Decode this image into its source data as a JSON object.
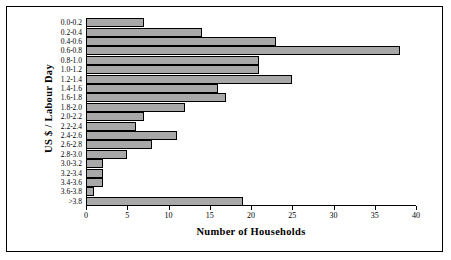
{
  "chart_data": {
    "type": "bar",
    "orientation": "horizontal",
    "title": "",
    "xlabel": "Number of Households",
    "ylabel": "US $ / Labour Day",
    "xlim": [
      0,
      40
    ],
    "xticks": [
      0,
      5,
      10,
      15,
      20,
      25,
      30,
      35,
      40
    ],
    "grid": false,
    "legend": null,
    "bar_color": "#a8a8a8",
    "bar_edge_color": "#000000",
    "categories": [
      "0.0-0.2",
      "0.2-0.4",
      "0.4-0.6",
      "0.6-0.8",
      "0.8-1.0",
      "1.0-1.2",
      "1.2-1.4",
      "1.4-1.6",
      "1.6-1.8",
      "1.8-2.0",
      "2.0-2.2",
      "2.2-2.4",
      "2.4-2.6",
      "2.6-2.8",
      "2.8-3.0",
      "3.0-3.2",
      "3.2-3.4",
      "3.4-3.6",
      "3.6-3.8",
      ">3.8"
    ],
    "values": [
      7,
      14,
      23,
      38,
      21,
      21,
      25,
      16,
      17,
      12,
      7,
      6,
      11,
      8,
      5,
      2,
      2,
      2,
      1,
      19
    ]
  },
  "axes": {
    "x_tick_labels": [
      "0",
      "5",
      "10",
      "15",
      "20",
      "25",
      "30",
      "35",
      "40"
    ],
    "x_axis_label": "Number of Households",
    "y_axis_label": "US $ / Labour Day"
  }
}
